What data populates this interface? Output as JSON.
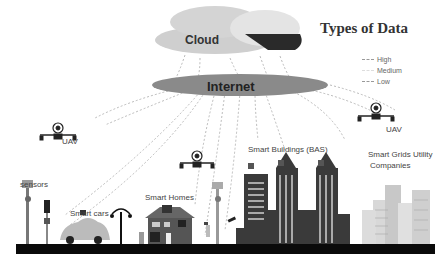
{
  "title": "Types of Data",
  "cloud": {
    "label": "Cloud"
  },
  "internet": {
    "label": "Internet"
  },
  "legend": [
    {
      "label": "High",
      "style": "dashed-dark"
    },
    {
      "label": "Medium",
      "style": "dashed-light"
    },
    {
      "label": "Low",
      "style": "dashed-dark"
    }
  ],
  "nodes": {
    "uav_left": "UAV",
    "uav_right": "UAV",
    "sensors": "sensors",
    "smart_cars": "Smart cars",
    "smart_homes": "Smart Homes",
    "smart_buildings": "Smart Buildings (BAS)",
    "smart_grids_line1": "Smart Grids Utility",
    "smart_grids_line2": "Companies"
  },
  "link_labels": [
    "GPS data",
    "Connection Logs",
    "Flight Logs",
    "Traffic data",
    "GPS data",
    "Usage Logs",
    "Connection Logs",
    "Bill data",
    "Access Logs",
    "Usage Logs",
    "Sensor data"
  ],
  "colors": {
    "cloud_light": "#cfcfcf",
    "cloud_dark": "#2a2a2a",
    "internet": "#8a8a8a",
    "road": "#0a0a0a",
    "building": "#3a3a3a"
  }
}
